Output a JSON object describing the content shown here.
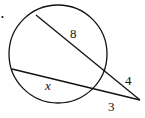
{
  "diagram": {
    "type": "circle-two-secants",
    "circle": {
      "cx": 58,
      "cy": 54,
      "r": 49
    },
    "external_point": {
      "x": 140,
      "y": 100
    },
    "secant_upper": {
      "start": {
        "x": 36,
        "y": 15
      },
      "inner_label": "8",
      "outer_label": "4"
    },
    "secant_lower": {
      "start": {
        "x": 12,
        "y": 69
      },
      "inner_label": "x",
      "outer_label": "3"
    },
    "bullet": "."
  }
}
